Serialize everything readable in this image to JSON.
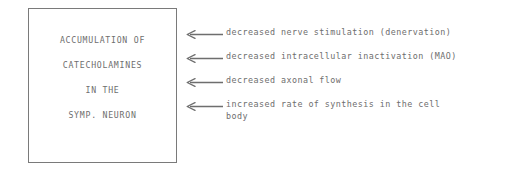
{
  "figure": {
    "background_color": "#ffffff",
    "ink_color": "#6e6e6e",
    "border_color": "#7a7a7a"
  },
  "concept_box": {
    "lines": [
      {
        "text": "ACCUMULATION OF"
      },
      {
        "text": "CATECHOLAMINES"
      },
      {
        "text": "IN THE"
      },
      {
        "text": "SYMP. NEURON"
      }
    ]
  },
  "annotations": [
    {
      "arrow_icon": "arrow-left-icon",
      "text": "decreased nerve stimulation (denervation)",
      "continuation": ""
    },
    {
      "arrow_icon": "arrow-left-icon",
      "text": "decreased intracellular inactivation (MAO)",
      "continuation": ""
    },
    {
      "arrow_icon": "arrow-left-icon",
      "text": "decreased axonal flow",
      "continuation": ""
    },
    {
      "arrow_icon": "arrow-left-icon",
      "text": "increased rate of synthesis in the cell",
      "continuation": "body"
    }
  ]
}
